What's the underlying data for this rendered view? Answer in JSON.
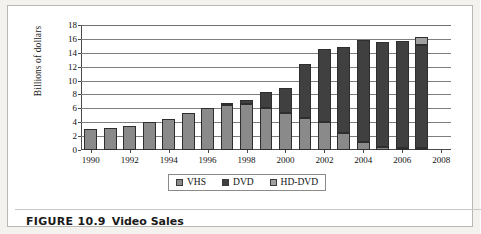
{
  "figure": {
    "caption_number": "FIGURE 10.9",
    "caption_title": "Video Sales"
  },
  "colors": {
    "vhs": "#8a8a8a",
    "dvd": "#404040",
    "hddvd": "#9f9f9f",
    "gridline": "#7d7d7d",
    "axis": "#4a4a4a",
    "panel_border": "#b9b7b3",
    "page_background": "#f3f2ef"
  },
  "chart_data": {
    "type": "bar",
    "subtype": "stacked",
    "title": "Video Sales",
    "xlabel": "",
    "ylabel": "Billions of dollars",
    "ylim": [
      0,
      18
    ],
    "ytick_step": 2,
    "yticks": [
      0,
      2,
      4,
      6,
      8,
      10,
      12,
      14,
      16,
      18
    ],
    "ytick_labels": [
      "0",
      "2",
      "4",
      "6",
      "8",
      "10",
      "12",
      "14",
      "16",
      "18"
    ],
    "xlim": [
      1989.5,
      2008.5
    ],
    "xticks": [
      1990,
      1992,
      1994,
      1996,
      1998,
      2000,
      2002,
      2004,
      2006,
      2008
    ],
    "xtick_labels": [
      "1990",
      "1992",
      "1994",
      "1996",
      "1998",
      "2000",
      "2002",
      "2004",
      "2006",
      "2008"
    ],
    "categories": [
      1990,
      1991,
      1992,
      1993,
      1994,
      1995,
      1996,
      1997,
      1998,
      1999,
      2000,
      2001,
      2002,
      2003,
      2004,
      2005,
      2006,
      2007
    ],
    "grid": "horizontal",
    "legend_position": "bottom",
    "series": [
      {
        "name": "VHS",
        "color": "#8a8a8a",
        "values": [
          3.0,
          3.2,
          3.5,
          4.0,
          4.5,
          5.3,
          6.1,
          6.5,
          6.6,
          6.0,
          5.3,
          4.6,
          4.0,
          2.5,
          1.1,
          0.5,
          0.3,
          0.3
        ]
      },
      {
        "name": "DVD",
        "color": "#404040",
        "values": [
          0,
          0,
          0,
          0,
          0,
          0,
          0,
          0.1,
          0.6,
          2.3,
          3.6,
          7.8,
          10.5,
          12.3,
          14.7,
          15.1,
          15.4,
          14.8
        ]
      },
      {
        "name": "HD-DVD",
        "color": "#9f9f9f",
        "values": [
          0,
          0,
          0,
          0,
          0,
          0,
          0,
          0,
          0,
          0,
          0,
          0,
          0,
          0,
          0,
          0,
          0,
          1.2
        ]
      }
    ],
    "totals": [
      3.0,
      3.2,
      3.5,
      4.0,
      4.5,
      5.3,
      6.1,
      6.6,
      7.2,
      8.3,
      8.9,
      12.4,
      14.5,
      14.8,
      15.8,
      15.6,
      15.7,
      16.3
    ]
  },
  "legend": {
    "entries": [
      {
        "label": "VHS",
        "swatch": "#8a8a8a"
      },
      {
        "label": "DVD",
        "swatch": "#404040"
      },
      {
        "label": "HD-DVD",
        "swatch": "#9f9f9f"
      }
    ]
  }
}
